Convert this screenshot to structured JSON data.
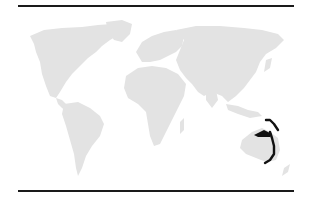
{
  "map": {
    "type": "world-map",
    "land_color": "#e3e3e3",
    "highlight_color": "#111111",
    "rule_color": "#1a1a1a",
    "highlighted_region": "Eastern Australia / Papua New Guinea / Solomon Islands"
  }
}
